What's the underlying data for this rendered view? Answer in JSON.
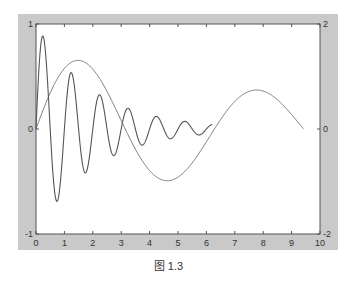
{
  "figure": {
    "caption": "图 1.3",
    "frame_color": "#c9c9c9",
    "plot_bg": "#ffffff",
    "line_color_fast": "#555555",
    "line_color_slow": "#777777",
    "axis_color": "#555555"
  },
  "chart_data": {
    "type": "line",
    "title": "",
    "xlabel": "",
    "ylabel_left": "",
    "ylabel_right": "",
    "xlim": [
      0,
      10
    ],
    "ylim_left": [
      -1,
      1
    ],
    "ylim_right": [
      -2,
      2
    ],
    "grid": false,
    "legend": null,
    "x_ticks": [
      0,
      1,
      2,
      3,
      4,
      5,
      6,
      7,
      8,
      9,
      10
    ],
    "x_tick_labels": [
      "0",
      "1",
      "2",
      "3",
      "4",
      "5",
      "6",
      "7",
      "8",
      "9",
      "10"
    ],
    "y_left_tick_labels": [
      "-1",
      "0",
      "1"
    ],
    "y_right_tick_labels": [
      "-2",
      "0",
      "2"
    ],
    "series": [
      {
        "name": "damped fast oscillation (left axis)",
        "axis": "left",
        "formula": "exp(-0.5x)*sin(2*pi*x)",
        "x_range": [
          0,
          6.2
        ],
        "key_points": [
          {
            "x": 0,
            "y": 0
          },
          {
            "x": 0.22,
            "y": 0.9
          },
          {
            "x": 0.75,
            "y": -0.7
          },
          {
            "x": 1.23,
            "y": 0.53
          },
          {
            "x": 1.75,
            "y": -0.42
          },
          {
            "x": 2.2,
            "y": 0.31
          },
          {
            "x": 2.7,
            "y": -0.16
          },
          {
            "x": 3.2,
            "y": 0.18
          },
          {
            "x": 3.7,
            "y": -0.11
          },
          {
            "x": 4.2,
            "y": 0.11
          },
          {
            "x": 4.7,
            "y": -0.08
          },
          {
            "x": 5.2,
            "y": 0.07
          },
          {
            "x": 5.7,
            "y": -0.05
          },
          {
            "x": 6.2,
            "y": 0.03
          }
        ]
      },
      {
        "name": "damped slow sine (right axis)",
        "axis": "right",
        "formula": "1.5*exp(-0.09x)*sin(x)",
        "x_range": [
          0,
          9.42
        ],
        "key_points": [
          {
            "x": 0,
            "y": 0
          },
          {
            "x": 1.5,
            "y": 1.28
          },
          {
            "x": 3.14,
            "y": 0
          },
          {
            "x": 4.7,
            "y": -0.98
          },
          {
            "x": 6.28,
            "y": 0
          },
          {
            "x": 7.8,
            "y": 0.67
          },
          {
            "x": 9.42,
            "y": 0
          }
        ]
      }
    ]
  }
}
